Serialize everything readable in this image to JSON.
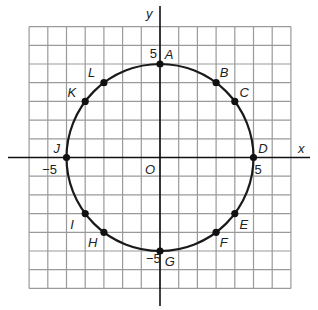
{
  "diagram": {
    "title": "",
    "axes": {
      "x_label": "x",
      "y_label": "y",
      "origin_label": "O",
      "range": [
        -7,
        7
      ]
    },
    "tick_labels": [
      {
        "id": "y5",
        "text": "5",
        "x": -0.55,
        "y": 5.3
      },
      {
        "id": "ym5",
        "text": "−5",
        "x": -0.75,
        "y": -5.65
      },
      {
        "id": "x5",
        "text": "5",
        "x": 5.05,
        "y": -0.9
      },
      {
        "id": "xm5",
        "text": "−5",
        "x": -6.3,
        "y": -0.9
      }
    ],
    "circle": {
      "center": [
        0,
        0
      ],
      "radius": 5,
      "color": "#1a1a1a"
    },
    "points": [
      {
        "label": "A",
        "x": 0,
        "y": 5,
        "dx": 0.25,
        "dy": 0.25
      },
      {
        "label": "B",
        "x": 3,
        "y": 4,
        "dx": 0.2,
        "dy": 0.3
      },
      {
        "label": "C",
        "x": 4,
        "y": 3,
        "dx": 0.25,
        "dy": 0.25
      },
      {
        "label": "D",
        "x": 5,
        "y": 0,
        "dx": 0.25,
        "dy": 0.25
      },
      {
        "label": "E",
        "x": 4,
        "y": -3,
        "dx": 0.25,
        "dy": -0.8
      },
      {
        "label": "F",
        "x": 3,
        "y": -4,
        "dx": 0.2,
        "dy": -0.8
      },
      {
        "label": "G",
        "x": 0,
        "y": -5,
        "dx": 0.25,
        "dy": -0.8
      },
      {
        "label": "H",
        "x": -3,
        "y": -4,
        "dx": -0.85,
        "dy": -0.8
      },
      {
        "label": "I",
        "x": -4,
        "y": -3,
        "dx": -0.8,
        "dy": -0.8
      },
      {
        "label": "J",
        "x": -5,
        "y": 0,
        "dx": -0.7,
        "dy": 0.25
      },
      {
        "label": "K",
        "x": -4,
        "y": 3,
        "dx": -0.95,
        "dy": 0.25
      },
      {
        "label": "L",
        "x": -3,
        "y": 4,
        "dx": -0.85,
        "dy": 0.3
      }
    ],
    "colors": {
      "grid": "#9a9a9a",
      "axis": "#111111",
      "point": "#111111"
    }
  }
}
